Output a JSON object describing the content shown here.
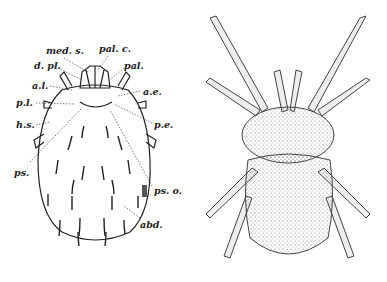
{
  "figure": {
    "left_panel": {
      "description": "Labeled dorsal outline diagram of a mite",
      "labels": {
        "med_s": "med. s.",
        "pal_c": "pal. c.",
        "d_pl": "d. pl.",
        "pal": "pal.",
        "a_l": "a.l.",
        "a_e": "a.e.",
        "p_l": "p.l.",
        "p_e": "p.e.",
        "h_s": "h.s.",
        "ps": "ps.",
        "ps_o": "ps. o.",
        "abd": "abd."
      }
    },
    "right_panel": {
      "description": "Stippled dorsal illustration of a hairy mite"
    },
    "colors": {
      "ink": "#222222",
      "background": "#ffffff",
      "stipple": "#777777"
    }
  }
}
